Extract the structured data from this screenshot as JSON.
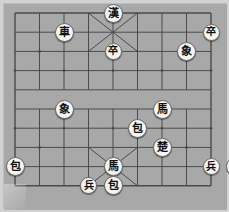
{
  "app": {
    "title": "Xiangqi Board",
    "board_background_color": "#a8a8a8",
    "frame_color": "#d2d2d2",
    "line_color": "#4a4a4a",
    "piece_face_color": "#f4f4f2",
    "piece_edge_color": "#6b6b6b",
    "piece_text_color": "#111111"
  },
  "board": {
    "columns": 9,
    "rows": 10,
    "left": 11,
    "top": 9,
    "cell_width": 24.5,
    "cell_height": 19.2,
    "river_between_rows": [
      4,
      5
    ],
    "palace_top": {
      "cols": [
        3,
        5
      ],
      "rows": [
        0,
        2
      ]
    },
    "palace_bottom": {
      "cols": [
        3,
        5
      ],
      "rows": [
        7,
        9
      ]
    },
    "star_points": [
      {
        "col": 1,
        "row": 2
      },
      {
        "col": 7,
        "row": 2
      },
      {
        "col": 0,
        "row": 3
      },
      {
        "col": 2,
        "row": 3
      },
      {
        "col": 4,
        "row": 3
      },
      {
        "col": 6,
        "row": 3
      },
      {
        "col": 8,
        "row": 3
      },
      {
        "col": 0,
        "row": 6
      },
      {
        "col": 2,
        "row": 6
      },
      {
        "col": 4,
        "row": 6
      },
      {
        "col": 6,
        "row": 6
      },
      {
        "col": 8,
        "row": 6
      },
      {
        "col": 1,
        "row": 7
      },
      {
        "col": 7,
        "row": 7
      }
    ]
  },
  "pieces": [
    {
      "id": "p1",
      "label": "漢",
      "name": "general-han",
      "col": 4,
      "row": 0,
      "size": "big"
    },
    {
      "id": "p2",
      "label": "車",
      "name": "chariot-top-left",
      "col": 2,
      "row": 1,
      "size": "big"
    },
    {
      "id": "p3",
      "label": "卒",
      "name": "soldier-center-top",
      "col": 4,
      "row": 2,
      "size": "normal"
    },
    {
      "id": "p4",
      "label": "卒",
      "name": "soldier-top-right",
      "col": 8,
      "row": 1,
      "size": "normal"
    },
    {
      "id": "p5",
      "label": "象",
      "name": "elephant-right",
      "col": 7,
      "row": 2,
      "size": "big"
    },
    {
      "id": "p6",
      "label": "象",
      "name": "elephant-left",
      "col": 2,
      "row": 5,
      "size": "big"
    },
    {
      "id": "p7",
      "label": "馬",
      "name": "horse-right",
      "col": 6,
      "row": 5,
      "size": "big"
    },
    {
      "id": "p8",
      "label": "包",
      "name": "cannon-center",
      "col": 5,
      "row": 6,
      "size": "big"
    },
    {
      "id": "p9",
      "label": "楚",
      "name": "general-chu",
      "col": 6,
      "row": 7,
      "size": "big"
    },
    {
      "id": "p10",
      "label": "包",
      "name": "cannon-left-edge",
      "col": 0,
      "row": 8,
      "size": "big"
    },
    {
      "id": "p11",
      "label": "馬",
      "name": "horse-bottom",
      "col": 4,
      "row": 8,
      "size": "big"
    },
    {
      "id": "p12",
      "label": "包",
      "name": "cannon-bottom",
      "col": 4,
      "row": 9,
      "size": "big"
    },
    {
      "id": "p13",
      "label": "兵",
      "name": "soldier-bottom-left",
      "col": 3,
      "row": 9,
      "size": "normal"
    },
    {
      "id": "p14",
      "label": "兵",
      "name": "soldier-bottom-right",
      "col": 8,
      "row": 8,
      "size": "normal"
    },
    {
      "id": "p15",
      "label": "車",
      "name": "chariot-bottom-right",
      "col": 9,
      "row": 8,
      "size": "big"
    }
  ]
}
